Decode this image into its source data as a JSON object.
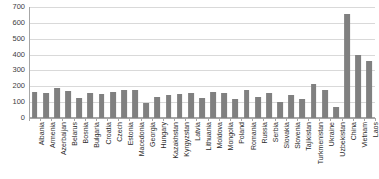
{
  "chart_data": {
    "type": "bar",
    "title": "",
    "subtitle": "",
    "xlabel": "",
    "ylabel": "",
    "ylim": [
      0,
      700
    ],
    "ytick_values": [
      0,
      100,
      200,
      300,
      400,
      500,
      600,
      700
    ],
    "ytick_labels": [
      "0",
      "100",
      "200",
      "300",
      "400",
      "500",
      "600",
      "700"
    ],
    "grid": true,
    "legend": false,
    "legend_position": "none",
    "bar_color": "#808080",
    "grid_color": "#D9D9D9",
    "axis_color": "#A6A6A6",
    "categories": [
      "Albania",
      "Armenia",
      "Azerbaijan",
      "Belarus",
      "Bosnia",
      "Bulgaria",
      "Croatia",
      "Czech",
      "Estonia",
      "Macedonia",
      "Georgia",
      "Hungary",
      "Kazakhstan",
      "Kyrgyzstan",
      "Latvia",
      "Lithuania",
      "Moldova",
      "Mongolia",
      "Poland",
      "Romania",
      "Russia",
      "Serbia",
      "Slovakia",
      "Slovenia",
      "Tajikistan",
      "Turkmenistan",
      "Ukraine",
      "Uzbekistan",
      "China",
      "Vietnam",
      "Laos"
    ],
    "values": [
      165,
      158,
      190,
      170,
      126,
      158,
      152,
      165,
      177,
      177,
      95,
      133,
      145,
      152,
      158,
      126,
      165,
      158,
      120,
      177,
      133,
      158,
      101,
      145,
      120,
      215,
      177,
      70,
      656,
      397,
      359
    ]
  }
}
